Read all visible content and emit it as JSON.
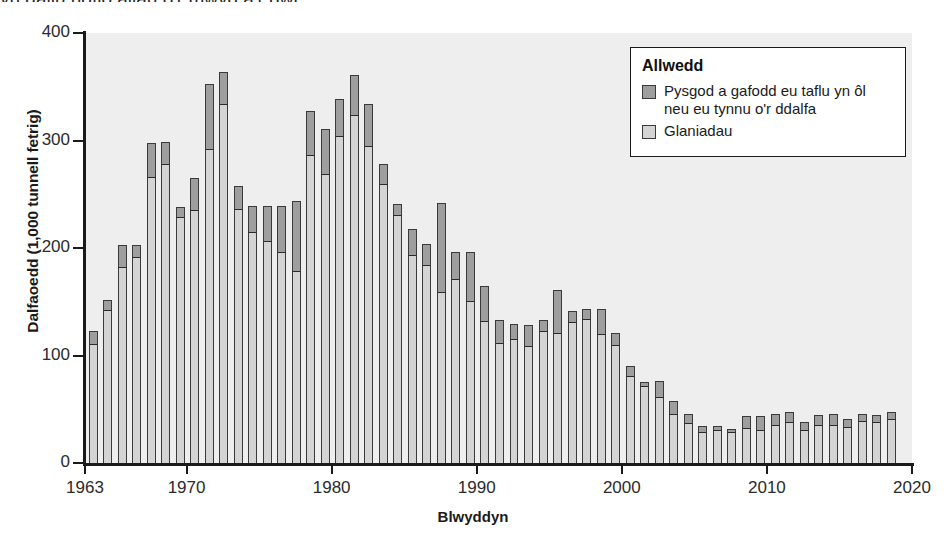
{
  "top_text": "yn gallu nofio allan o'r mwyd a'r dŵr.",
  "axis": {
    "ylabel": "Dalfaoedd (1,000 tunnell fetrig)",
    "xlabel": "Blwyddyn",
    "yticks": [
      "0",
      "100",
      "200",
      "300",
      "400"
    ],
    "xticks": [
      "1963",
      "1970",
      "1980",
      "1990",
      "2000",
      "2010",
      "2020"
    ]
  },
  "legend": {
    "title": "Allwedd",
    "items": [
      {
        "label": "Pysgod a gafodd eu taflu yn ôl neu eu tynnu o'r ddalfa",
        "color": "#9e9e9e"
      },
      {
        "label": "Glaniadau",
        "color": "#d4d4d4"
      }
    ]
  },
  "colors": {
    "plot_background": "#eeeeee",
    "landings": "#d4d4d4",
    "discards": "#9e9e9e",
    "axis": "#1a1a1a"
  },
  "chart_data": {
    "type": "bar",
    "subtype": "stacked-bar",
    "title": "",
    "xlabel": "Blwyddyn",
    "ylabel": "Dalfaoedd (1,000 tunnell fetrig)",
    "xlim": [
      1963,
      2020
    ],
    "ylim": [
      0,
      400
    ],
    "ytick_interval": 100,
    "grid": false,
    "legend_position": "top-right",
    "categories": [
      1963,
      1964,
      1965,
      1966,
      1967,
      1968,
      1969,
      1970,
      1971,
      1972,
      1973,
      1974,
      1975,
      1976,
      1977,
      1978,
      1979,
      1980,
      1981,
      1982,
      1983,
      1984,
      1985,
      1986,
      1987,
      1988,
      1989,
      1990,
      1991,
      1992,
      1993,
      1994,
      1995,
      1996,
      1997,
      1998,
      1999,
      2000,
      2001,
      2002,
      2003,
      2004,
      2005,
      2006,
      2007,
      2008,
      2009,
      2010,
      2011,
      2012,
      2013,
      2014,
      2015,
      2016,
      2017,
      2018
    ],
    "series": [
      {
        "name": "Glaniadau",
        "values": [
          110,
          141,
          181,
          191,
          265,
          277,
          228,
          234,
          291,
          333,
          235,
          214,
          206,
          195,
          178,
          286,
          268,
          303,
          323,
          294,
          259,
          230,
          193,
          183,
          158,
          170,
          150,
          131,
          111,
          114,
          108,
          122,
          120,
          130,
          133,
          119,
          109,
          80,
          71,
          60,
          45,
          36,
          28,
          30,
          28,
          32,
          30,
          34,
          37,
          30,
          34,
          34,
          33,
          38,
          37,
          40
        ]
      },
      {
        "name": "Pysgod a gafodd eu taflu yn ôl neu eu tynnu o'r ddalfa",
        "values": [
          13,
          11,
          22,
          12,
          33,
          22,
          10,
          31,
          62,
          31,
          23,
          25,
          33,
          44,
          66,
          41,
          43,
          36,
          38,
          40,
          19,
          11,
          25,
          21,
          84,
          26,
          46,
          34,
          22,
          15,
          20,
          11,
          41,
          11,
          10,
          24,
          12,
          10,
          4,
          16,
          13,
          10,
          6,
          4,
          4,
          12,
          14,
          12,
          10,
          8,
          11,
          12,
          8,
          8,
          8,
          7
        ]
      }
    ],
    "totals": [
      123,
      152,
      203,
      203,
      298,
      299,
      238,
      265,
      353,
      364,
      258,
      239,
      239,
      239,
      244,
      327,
      311,
      339,
      361,
      334,
      278,
      241,
      218,
      204,
      242,
      196,
      196,
      165,
      133,
      129,
      128,
      133,
      161,
      141,
      143,
      143,
      121,
      90,
      75,
      76,
      58,
      46,
      34,
      34,
      32,
      44,
      44,
      46,
      47,
      38,
      45,
      46,
      41,
      46,
      45,
      47
    ]
  }
}
